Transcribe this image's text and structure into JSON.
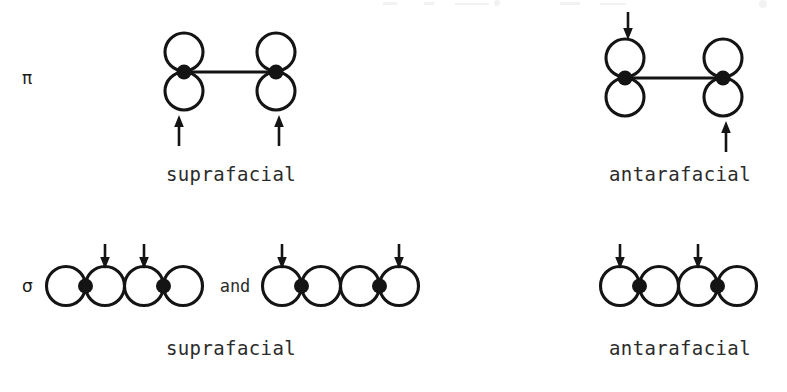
{
  "figure": {
    "type": "orbital-symmetry-diagram",
    "background_color": "#ffffff",
    "ink_color": "#141414",
    "text_color": "#2b2b2b",
    "conjunction": "and",
    "rows": [
      {
        "symbol": "π",
        "symbol_name": "pi",
        "panels": [
          {
            "caption": "suprafacial",
            "system": "pi-bond",
            "arrows": [
              "bottom-left",
              "bottom-right"
            ]
          },
          {
            "caption": "antarafacial",
            "system": "pi-bond",
            "arrows": [
              "top-left",
              "bottom-right"
            ]
          }
        ]
      },
      {
        "symbol": "σ",
        "symbol_name": "sigma",
        "panels": [
          {
            "caption": "suprafacial",
            "system": "sigma-bond",
            "chains": [
              {
                "lobes": 4,
                "arrows_on_lobes": [
                  2,
                  3
                ]
              },
              {
                "lobes": 4,
                "arrows_on_lobes": [
                  1,
                  4
                ]
              }
            ]
          },
          {
            "caption": "antarafacial",
            "system": "sigma-bond",
            "chains": [
              {
                "lobes": 4,
                "arrows_on_lobes": [
                  1,
                  3
                ]
              }
            ]
          }
        ]
      }
    ]
  },
  "labels": {
    "pi_symbol": "π",
    "sigma_symbol": "σ",
    "suprafacial_pi": "suprafacial",
    "antarafacial_pi": "antarafacial",
    "suprafacial_sigma": "suprafacial",
    "antarafacial_sigma": "antarafacial",
    "and": "and"
  }
}
